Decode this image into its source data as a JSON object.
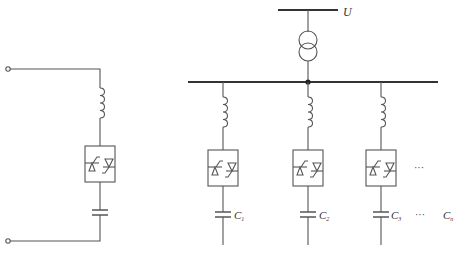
{
  "diagram": {
    "type": "circuit-schematic",
    "colors": {
      "line": "#555555",
      "bus": "#333333",
      "background": "#ffffff"
    },
    "single_branch": {
      "components": [
        "terminal",
        "inductor",
        "antiparallel-thyristor-pair",
        "capacitor",
        "terminal"
      ]
    },
    "supply": {
      "voltage_label": "U",
      "transformer": "two-winding"
    },
    "branches": [
      {
        "capacitor_label": "C",
        "subscript": "1"
      },
      {
        "capacitor_label": "C",
        "subscript": "2"
      },
      {
        "capacitor_label": "C",
        "subscript": "3"
      }
    ],
    "ellipsis_thyristor": "···",
    "ellipsis_capacitor": "···",
    "last_capacitor": {
      "label": "C",
      "subscript": "n"
    }
  }
}
